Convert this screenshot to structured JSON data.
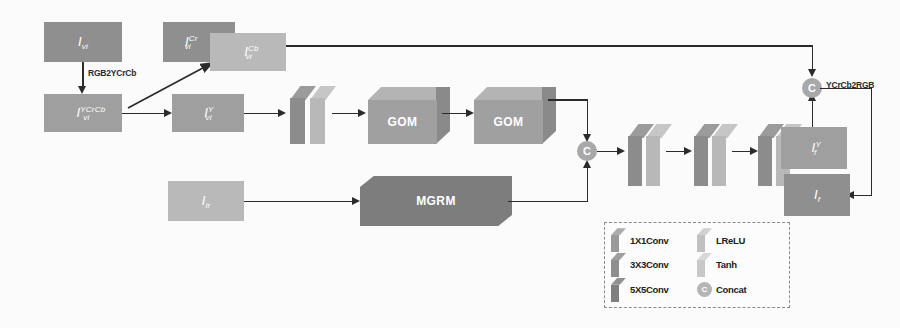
{
  "figure": {
    "type": "neural-network-architecture-diagram",
    "background_color": "#fbfbfb",
    "line_color": "#2b2b2b"
  },
  "blocks": {
    "vis_rgb": {
      "label": "I",
      "sub": "vi",
      "sup": "",
      "color": "#8f8f8f"
    },
    "vis_ycrcb": {
      "label": "I",
      "sub": "vi",
      "sup": "YCrCb",
      "color": "#9f9f9f"
    },
    "vis_cr": {
      "label": "I",
      "sub": "vi",
      "sup": "Cr",
      "color": "#939393"
    },
    "vis_cb": {
      "label": "I",
      "sub": "vi",
      "sup": "Cb",
      "color": "#b0b0b0"
    },
    "vis_y": {
      "label": "I",
      "sub": "vi",
      "sup": "Y",
      "color": "#a2a2a2"
    },
    "ir": {
      "label": "I",
      "sub": "ir",
      "sup": "",
      "color": "#aeaeae"
    },
    "fused_y": {
      "label": "I",
      "sub": "f",
      "sup": "Y",
      "color": "#a5a5a5"
    },
    "fused_rgb": {
      "label": "I",
      "sub": "f",
      "sup": "",
      "color": "#8a8a8a"
    }
  },
  "modules": {
    "gom_1": {
      "label": "GOM",
      "color": "#a0a0a0"
    },
    "gom_2": {
      "label": "GOM",
      "color": "#a0a0a0"
    },
    "mgrm": {
      "label": "MGRM",
      "color": "#7d7d7d"
    }
  },
  "operators": {
    "concat_features": {
      "label": "C",
      "name": "feature-concat",
      "color": "#a8a8a8"
    },
    "concat_color": {
      "label": "C",
      "name": "color-concat",
      "color": "#a8a8a8"
    }
  },
  "captions": {
    "rgb_to_ycrcb": "RGB2YCrCb",
    "ycrcb_to_rgb": "YCrCb2RGB"
  },
  "encoder": {
    "layers": [
      {
        "kind": "conv",
        "color": "#8c8c8c"
      },
      {
        "kind": "activation",
        "color": "#b8b8b8"
      }
    ]
  },
  "decoder": {
    "pair_count": 4,
    "layers": [
      {
        "kind": "conv",
        "color": "#8c8c8c"
      },
      {
        "kind": "activation",
        "color": "#b8b8b8"
      },
      {
        "kind": "conv",
        "color": "#8c8c8c"
      },
      {
        "kind": "activation",
        "color": "#b8b8b8"
      },
      {
        "kind": "conv",
        "color": "#8c8c8c"
      },
      {
        "kind": "activation",
        "color": "#b8b8b8"
      },
      {
        "kind": "conv",
        "color": "#8c8c8c"
      },
      {
        "kind": "activation",
        "color": "#b8b8b8"
      }
    ]
  },
  "legend": {
    "items": [
      {
        "icon": "conv-slab-1x1",
        "label": "1X1Conv",
        "color": "#9a9a9a"
      },
      {
        "icon": "lrelu-slab",
        "label": "LReLU",
        "color": "#c0c0c0"
      },
      {
        "icon": "conv-slab-3x3",
        "label": "3X3Conv",
        "color": "#8e8e8e"
      },
      {
        "icon": "tanh-slab",
        "label": "Tanh",
        "color": "#c8c8c8"
      },
      {
        "icon": "conv-slab-5x5",
        "label": "5X5Conv",
        "color": "#808080"
      },
      {
        "icon": "concat-circle",
        "label": "Concat",
        "color": "#b5b5b5"
      }
    ]
  }
}
